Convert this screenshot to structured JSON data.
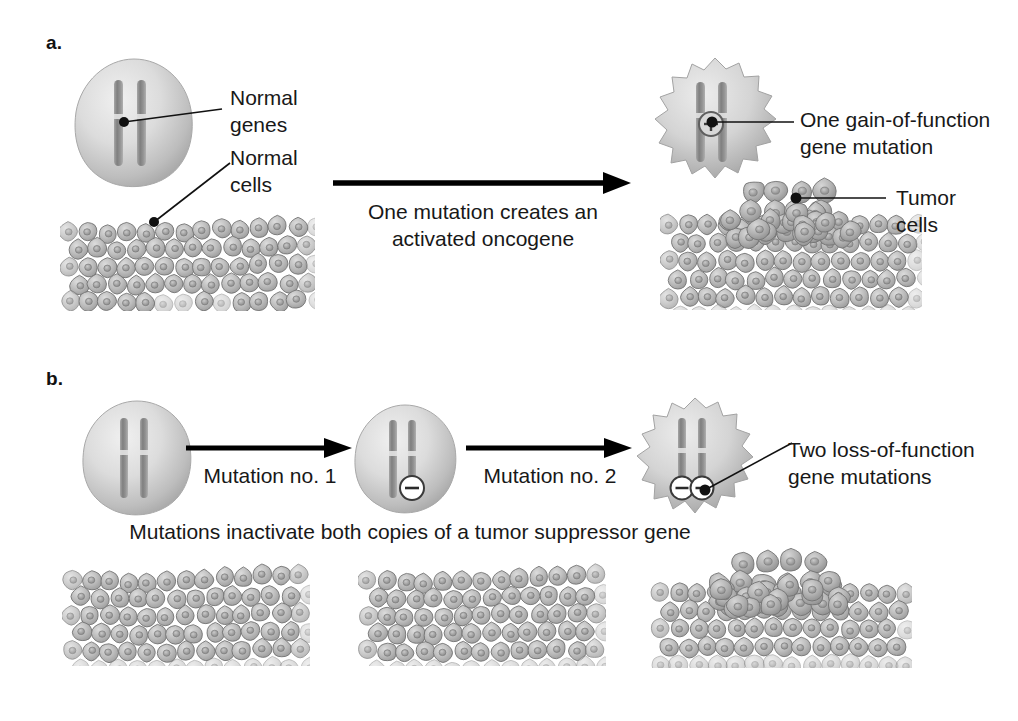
{
  "figure": {
    "title_present": false,
    "background": "#ffffff",
    "ink": "#181818"
  },
  "panels": [
    {
      "id": "a",
      "letter": "a.",
      "arrow_caption_line1": "One mutation creates an",
      "arrow_caption_line2": "activated oncogene",
      "labels": [
        {
          "name": "normal-genes",
          "line1": "Normal",
          "line2": "genes"
        },
        {
          "name": "normal-cells",
          "line1": "Normal",
          "line2": "cells"
        },
        {
          "name": "gain-of-function",
          "line1": "One gain-of-function",
          "line2": "gene mutation"
        },
        {
          "name": "tumor-cells",
          "line1": "Tumor",
          "line2": "cells"
        }
      ],
      "nuclei": [
        {
          "name": "normal-nucleus",
          "shape": "round",
          "marks": []
        },
        {
          "name": "mutant-nucleus",
          "shape": "irregular",
          "marks": [
            "plus"
          ]
        }
      ],
      "tissues": [
        {
          "name": "normal-tissue",
          "type": "flat"
        },
        {
          "name": "tumor-tissue",
          "type": "mound"
        }
      ]
    },
    {
      "id": "b",
      "letter": "b.",
      "arrow1_caption": "Mutation no. 1",
      "arrow2_caption": "Mutation no. 2",
      "caption": "Mutations inactivate both copies of a tumor suppressor gene",
      "labels": [
        {
          "name": "loss-of-function",
          "line1": "Two loss-of-function",
          "line2": "gene mutations"
        }
      ],
      "nuclei": [
        {
          "name": "normal-nucleus",
          "shape": "round",
          "marks": []
        },
        {
          "name": "one-hit-nucleus",
          "shape": "round",
          "marks": [
            "minus"
          ]
        },
        {
          "name": "two-hit-nucleus",
          "shape": "irregular",
          "marks": [
            "minus",
            "minus"
          ]
        }
      ],
      "tissues": [
        {
          "name": "normal-tissue-1",
          "type": "flat"
        },
        {
          "name": "normal-tissue-2",
          "type": "flat"
        },
        {
          "name": "tumor-tissue",
          "type": "mound"
        }
      ]
    }
  ],
  "symbols": {
    "plus_glyph": "+",
    "minus_glyph": "–",
    "plus_name": "circled-plus-icon",
    "minus_name": "circled-minus-icon"
  },
  "colors": {
    "cell_fill": "#b4b4b4",
    "cell_stroke": "#6e6e6e",
    "nucleus_light": "#e9e9e9",
    "nucleus_dark": "#9a9a9a",
    "chromosome": "#8e8e8e",
    "arrow": "#000000",
    "leader": "#111111"
  }
}
